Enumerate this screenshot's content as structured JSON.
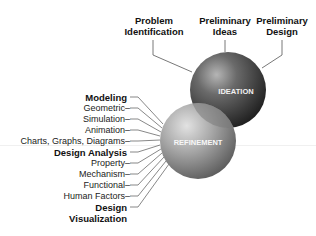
{
  "top_labels": [
    {
      "line1": "Problem",
      "line2": "Identification"
    },
    {
      "line1": "Preliminary",
      "line2": "Ideas"
    },
    {
      "line1": "Preliminary",
      "line2": "Design"
    }
  ],
  "spheres": {
    "ideation": "IDEATION",
    "refinement": "REFINEMENT"
  },
  "left_labels": [
    {
      "text": "Modeling",
      "bold": true
    },
    {
      "text": "Geometric–",
      "bold": false
    },
    {
      "text": "Simulation–",
      "bold": false
    },
    {
      "text": "Animation–",
      "bold": false
    },
    {
      "text": "Charts, Graphs, Diagrams–",
      "bold": false
    },
    {
      "text": "Design Analysis",
      "bold": true
    },
    {
      "text": "Property–",
      "bold": false
    },
    {
      "text": "Mechanism–",
      "bold": false
    },
    {
      "text": "Functional–",
      "bold": false
    },
    {
      "text": "Human Factors–",
      "bold": false
    },
    {
      "text": "Design",
      "bold": true
    },
    {
      "text": "Visualization",
      "bold": true
    }
  ],
  "colors": {
    "ideation_dark": "#3a3a3a",
    "refinement_light": "#9a9a9a",
    "lines": "#555555"
  }
}
